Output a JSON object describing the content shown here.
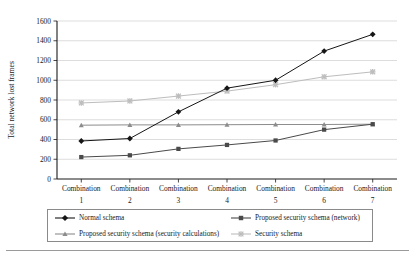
{
  "chart_data": {
    "type": "line",
    "title": "",
    "xlabel": "Random hops combinations",
    "ylabel": "Total network lost frames",
    "categories": [
      "Combination 1",
      "Combination 2",
      "Combination 3",
      "Combination 4",
      "Combination 5",
      "Combination 6",
      "Combination 7"
    ],
    "category_lines": [
      [
        "Combination",
        "1"
      ],
      [
        "Combination",
        "2"
      ],
      [
        "Combination",
        "3"
      ],
      [
        "Combination",
        "4"
      ],
      [
        "Combination",
        "5"
      ],
      [
        "Combination",
        "6"
      ],
      [
        "Combination",
        "7"
      ]
    ],
    "ylim": [
      0,
      1600
    ],
    "yticks": [
      0,
      200,
      400,
      600,
      800,
      1000,
      1200,
      1400,
      1600
    ],
    "ytick_labels": [
      "0",
      "200",
      "400",
      "600",
      "800",
      "1000",
      "1200",
      "1400",
      "1600"
    ],
    "grid": true,
    "grid_axis": "y",
    "legend_position": "bottom",
    "series": [
      {
        "name": "Normal schema",
        "marker": "diamond",
        "color": "#161616",
        "values": [
          385,
          410,
          680,
          920,
          1000,
          1295,
          1465
        ]
      },
      {
        "name": "Proposed security schema (network)",
        "marker": "square",
        "color": "#4a4a4a",
        "values": [
          222,
          240,
          305,
          345,
          390,
          500,
          555
        ]
      },
      {
        "name": "Proposed security schema (security calculations)",
        "marker": "triangle",
        "color": "#8c8c8c",
        "values": [
          545,
          548,
          548,
          550,
          552,
          552,
          555
        ]
      },
      {
        "name": "Security schema",
        "marker": "cross",
        "color": "#bdbdbd",
        "values": [
          770,
          790,
          840,
          890,
          955,
          1035,
          1085
        ]
      }
    ]
  },
  "legend": {
    "entries": [
      {
        "label": "Normal schema",
        "marker": "diamond",
        "color": "#161616"
      },
      {
        "label": "Proposed security schema (network)",
        "marker": "square",
        "color": "#4a4a4a"
      },
      {
        "label": "Proposed security schema (security calculations)",
        "marker": "triangle",
        "color": "#8c8c8c"
      },
      {
        "label": "Security schema",
        "marker": "cross",
        "color": "#bdbdbd"
      }
    ]
  },
  "colors": {
    "axis": "#1a1a1a",
    "grid": "#d4d4d4",
    "legend_border": "#8a8a8a",
    "bottom_rule": "#9a9a9a",
    "background": "#ffffff"
  }
}
